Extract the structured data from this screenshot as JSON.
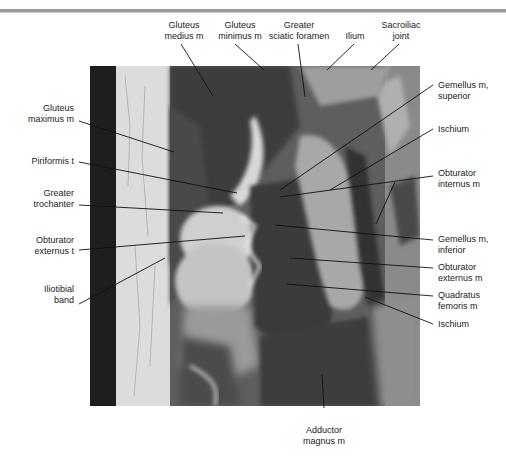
{
  "figure": {
    "type": "MRI coronal section, hip region (T1-weighted)",
    "colors": {
      "background": "#ffffff",
      "header_rule": "#9a9a9a",
      "label_text": "#222222",
      "leader_line": "#111111"
    }
  },
  "labels": {
    "top": [
      {
        "id": "gluteus-medius",
        "line1": "Gluteus",
        "line2": "medius m"
      },
      {
        "id": "gluteus-minimus",
        "line1": "Gluteus",
        "line2": "minimus m"
      },
      {
        "id": "greater-sciatic-foramen",
        "line1": "Greater",
        "line2": "sciatic foramen"
      },
      {
        "id": "ilium",
        "line1": "Ilium",
        "line2": ""
      },
      {
        "id": "sacroiliac-joint",
        "line1": "Sacroiliac",
        "line2": "joint"
      }
    ],
    "left": [
      {
        "id": "gluteus-maximus",
        "line1": "Gluteus",
        "line2": "maximus m"
      },
      {
        "id": "piriformis-t",
        "line1": "Piriformis t",
        "line2": ""
      },
      {
        "id": "greater-trochanter",
        "line1": "Greater",
        "line2": "trochanter"
      },
      {
        "id": "obturator-externus-t",
        "line1": "Obturator",
        "line2": "externus t"
      },
      {
        "id": "iliotibial-band",
        "line1": "Iliotibial",
        "line2": "band"
      }
    ],
    "right": [
      {
        "id": "gemellus-superior",
        "line1": "Gemellus m,",
        "line2": "superior"
      },
      {
        "id": "ischium-upper",
        "line1": "Ischium",
        "line2": ""
      },
      {
        "id": "obturator-internus",
        "line1": "Obturator",
        "line2": "internus m"
      },
      {
        "id": "gemellus-inferior",
        "line1": "Gemellus m,",
        "line2": "inferior"
      },
      {
        "id": "obturator-externus-m",
        "line1": "Obturator",
        "line2": "externus m"
      },
      {
        "id": "quadratus-femoris",
        "line1": "Quadratus",
        "line2": "femoris m"
      },
      {
        "id": "ischium-lower",
        "line1": "Ischium",
        "line2": ""
      }
    ],
    "bottom": [
      {
        "id": "adductor-magnus",
        "line1": "Adductor",
        "line2": "magnus m"
      }
    ]
  }
}
